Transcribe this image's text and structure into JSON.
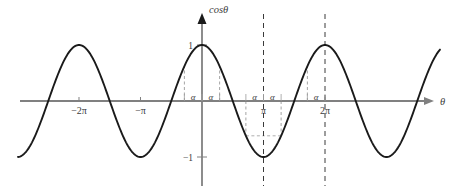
{
  "figure": {
    "title": "",
    "axis_labels": {
      "y": "cosθ",
      "x": "θ"
    },
    "y_ticks": [
      {
        "label": "1",
        "value": 1
      },
      {
        "label": "−1",
        "value": -1
      }
    ],
    "x_ticks": [
      {
        "label": "−2π",
        "value": -6.2832
      },
      {
        "label": "−π",
        "value": -3.1416
      },
      {
        "label": "π",
        "value": 3.1416
      },
      {
        "label": "2π",
        "value": 6.2832
      }
    ],
    "alpha_labels": [
      {
        "label": "α",
        "near": "-alpha-left-of-origin"
      },
      {
        "label": "α",
        "near": "alpha-right-of-origin"
      },
      {
        "label": "α",
        "near": "alpha-left-of-pi"
      },
      {
        "label": "α",
        "near": "alpha-right-of-pi"
      },
      {
        "label": "α",
        "near": "alpha-left-of-two-pi"
      }
    ],
    "colors": {
      "curve": "#1a1a1a",
      "axis": "#808080",
      "guide": "#9a9a9a",
      "dashed_marker": "#3a3a3a",
      "background": "#ffffff"
    }
  },
  "chart_data": {
    "type": "line",
    "title": "",
    "xlabel": "θ",
    "ylabel": "cosθ",
    "xlim": [
      -8.1,
      8.6
    ],
    "ylim": [
      -1.35,
      1.35
    ],
    "grid": false,
    "legend": null,
    "function": "y = cos(theta)",
    "amplitude": 1,
    "period": 6.2832,
    "x_tick_values": [
      -6.2832,
      -3.1416,
      3.1416,
      6.2832
    ],
    "x_tick_labels": [
      "−2π",
      "−π",
      "π",
      "2π"
    ],
    "y_tick_values": [
      1,
      -1
    ],
    "y_tick_labels": [
      "1",
      "−1"
    ],
    "annotations": {
      "alpha_value": 0.9,
      "vertical_dashed_lines": [
        3.1416,
        6.2832
      ],
      "guide_segments": [
        {
          "x": -0.9,
          "from_y": 0,
          "to_y": 0.6216
        },
        {
          "x": 0.9,
          "from_y": 0,
          "to_y": 0.6216
        },
        {
          "x": 2.2416,
          "from_y": 0,
          "to_y": -0.6216
        },
        {
          "x": 4.0416,
          "from_y": 0,
          "to_y": -0.6216
        },
        {
          "x": 5.3832,
          "from_y": 0,
          "to_y": 0.6216
        }
      ],
      "alpha_marks": [
        {
          "label": "α",
          "x_from": -0.9,
          "x_to": 0
        },
        {
          "label": "α",
          "x_from": 0,
          "x_to": 0.9
        },
        {
          "label": "α",
          "x_from": 2.2416,
          "x_to": 3.1416
        },
        {
          "label": "α",
          "x_from": 3.1416,
          "x_to": 4.0416
        },
        {
          "label": "α",
          "x_from": 5.3832,
          "x_to": 6.2832
        }
      ]
    },
    "series": [
      {
        "name": "cosθ",
        "x": [
          -8.1,
          -7.5,
          -7.0,
          -6.5,
          -6.2832,
          -6.0,
          -5.5,
          -5.0,
          -4.5,
          -4.0,
          -3.5,
          -3.1416,
          -3.0,
          -2.5,
          -2.0,
          -1.5,
          -1.0,
          -0.5,
          0.0,
          0.5,
          1.0,
          1.5,
          2.0,
          2.5,
          3.0,
          3.1416,
          3.5,
          4.0,
          4.5,
          5.0,
          5.5,
          6.0,
          6.2832,
          6.5,
          7.0,
          7.5,
          8.0,
          8.6
        ],
        "y": [
          -0.283,
          0.347,
          0.754,
          0.977,
          1.0,
          0.96,
          0.709,
          0.284,
          -0.211,
          -0.654,
          -0.936,
          -1.0,
          -0.99,
          -0.801,
          -0.416,
          0.071,
          0.54,
          0.878,
          1.0,
          0.878,
          0.54,
          0.071,
          -0.416,
          -0.801,
          -0.99,
          -1.0,
          -0.936,
          -0.654,
          -0.211,
          0.284,
          0.709,
          0.96,
          1.0,
          0.977,
          0.754,
          0.347,
          -0.146,
          -0.75
        ]
      }
    ]
  }
}
